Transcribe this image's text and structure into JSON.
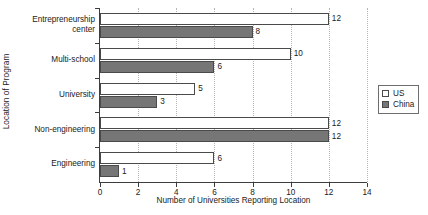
{
  "chart_data": {
    "type": "bar",
    "orientation": "horizontal",
    "title": "",
    "xlabel": "Number of Universities Reporting Location",
    "ylabel": "Location of Program",
    "xlim": [
      0,
      14
    ],
    "xticks": [
      0,
      2,
      4,
      6,
      8,
      10,
      12,
      14
    ],
    "grid": "vertical-dotted",
    "legend_position": "right",
    "categories": [
      "Entrepreneurship\ncenter",
      "Multi-school",
      "University",
      "Non-engineering",
      "Engineering"
    ],
    "series": [
      {
        "name": "US",
        "color": "#ffffff",
        "values": [
          12,
          10,
          5,
          12,
          6
        ]
      },
      {
        "name": "China",
        "color": "#767676",
        "values": [
          8,
          6,
          3,
          12,
          1
        ]
      }
    ],
    "data_labels": {
      "US": [
        "12",
        "10",
        "5",
        "12",
        "6"
      ],
      "China": [
        "8",
        "6",
        "3",
        "12",
        "1"
      ]
    }
  },
  "legend": {
    "entries": [
      {
        "label": "US"
      },
      {
        "label": "China"
      }
    ]
  },
  "axes": {
    "x_title": "Number of Universities Reporting Location",
    "y_title": "Location of Program",
    "x_tick_labels": [
      "0",
      "2",
      "4",
      "6",
      "8",
      "10",
      "12",
      "14"
    ]
  }
}
